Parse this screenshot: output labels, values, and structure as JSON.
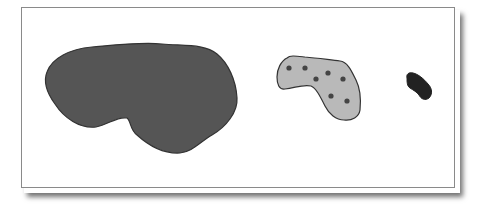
{
  "diagram": {
    "frame": {
      "border_color": "#8a8a8a",
      "background": "#ffffff"
    },
    "shapes": [
      {
        "name": "large-blob",
        "fill": "#555555",
        "stroke": "#333333",
        "path": "M 47 72 C 52 58, 70 49, 92 47 C 115 45, 140 42, 162 44 C 185 46, 205 44, 217 54 C 228 63, 236 80, 237 98 C 238 112, 226 127, 212 135 C 200 142, 192 152, 180 153 C 163 154, 148 145, 137 135 C 130 130, 131 121, 127 118 C 117 116, 108 125, 96 127 C 80 129, 64 118, 55 104 C 47 93, 43 82, 47 72 Z"
      },
      {
        "name": "dotted-blob",
        "fill": "#b9b9b9",
        "stroke": "#333333",
        "path": "M 287 58 C 290 55, 296 56, 305 57 C 318 58, 330 60, 340 61 C 348 62, 352 72, 356 80 C 360 88, 361 100, 360 110 C 359 117, 352 121, 344 120 C 336 120, 329 114, 325 106 C 320 96, 316 88, 311 86 C 303 84, 295 88, 285 89 C 279 90, 277 84, 277 77 C 277 69, 281 61, 287 58 Z",
        "dots": [
          {
            "cx": 289,
            "cy": 68
          },
          {
            "cx": 305,
            "cy": 68
          },
          {
            "cx": 316,
            "cy": 79
          },
          {
            "cx": 328,
            "cy": 73
          },
          {
            "cx": 343,
            "cy": 79
          },
          {
            "cx": 331,
            "cy": 96
          },
          {
            "cx": 347,
            "cy": 101
          }
        ],
        "dot_fill": "#444444",
        "dot_radius": 2.6
      },
      {
        "name": "small-blob",
        "fill": "#222222",
        "stroke": "#222222",
        "path": "M 407 78 C 406 74, 409 72, 413 73 C 418 74, 424 79, 428 84 C 432 88, 433 94, 429 98 C 425 101, 421 99, 419 95 C 417 92, 413 90, 410 88 C 407 86, 407 82, 407 78 Z"
      }
    ]
  }
}
